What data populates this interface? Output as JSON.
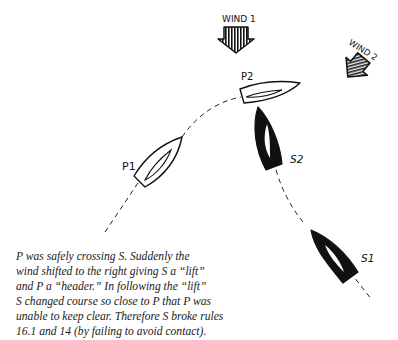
{
  "diagram": {
    "wind_labels": [
      "WIND 1",
      "WIND 2"
    ],
    "boats": [
      {
        "id": "P1",
        "label": "P1",
        "color": "white",
        "role": "port-tack boat, position 1"
      },
      {
        "id": "P2",
        "label": "P2",
        "color": "white",
        "role": "port-tack boat, position 2"
      },
      {
        "id": "S1",
        "label": "S1",
        "color": "black",
        "role": "starboard-tack boat, position 1"
      },
      {
        "id": "S2",
        "label": "S2",
        "color": "black",
        "role": "starboard-tack boat, position 2"
      }
    ],
    "track_style": "dashed",
    "colors": {
      "ink": "#111111",
      "background": "#ffffff",
      "caption": "#222222"
    }
  },
  "caption": {
    "lines": [
      "P was safely crossing S. Suddenly the",
      "wind shifted to the right giving S a “lift”",
      " and P a “header.” In following the “lift”",
      "S changed course so close to P that P was",
      "unable to keep clear. Therefore S broke rules",
      "16.1 and 14 (by failing to avoid contact)."
    ]
  }
}
